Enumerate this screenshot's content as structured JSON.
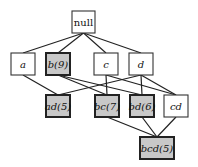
{
  "diagram": {
    "type": "itemset-lattice",
    "colors": {
      "edge": "#222222",
      "plain_fill": "#ffffff",
      "plain_border": "#333333",
      "frequent_fill": "#c8c8c8",
      "frequent_border": "#222222"
    },
    "nodes": [
      {
        "id": "null",
        "label": "null",
        "x": 72,
        "y": 11,
        "w": 23,
        "h": 22,
        "shaded": false,
        "italic": false
      },
      {
        "id": "a",
        "label": "a",
        "x": 11,
        "y": 53,
        "w": 24,
        "h": 22,
        "shaded": false,
        "italic": true
      },
      {
        "id": "b",
        "label": "b(9)",
        "x": 46,
        "y": 53,
        "w": 24,
        "h": 22,
        "shaded": true,
        "italic": true
      },
      {
        "id": "c",
        "label": "c",
        "x": 94,
        "y": 53,
        "w": 24,
        "h": 22,
        "shaded": false,
        "italic": true
      },
      {
        "id": "d",
        "label": "d",
        "x": 129,
        "y": 53,
        "w": 24,
        "h": 22,
        "shaded": false,
        "italic": true
      },
      {
        "id": "ad",
        "label": "ad(5)",
        "x": 46,
        "y": 95,
        "w": 24,
        "h": 22,
        "shaded": true,
        "italic": true
      },
      {
        "id": "bc",
        "label": "bc(7)",
        "x": 95,
        "y": 95,
        "w": 24,
        "h": 22,
        "shaded": true,
        "italic": true
      },
      {
        "id": "bd",
        "label": "bd(6)",
        "x": 130,
        "y": 95,
        "w": 24,
        "h": 22,
        "shaded": true,
        "italic": true
      },
      {
        "id": "cd",
        "label": "cd",
        "x": 164,
        "y": 95,
        "w": 24,
        "h": 22,
        "shaded": false,
        "italic": true
      },
      {
        "id": "bcd",
        "label": "bcd(5)",
        "x": 140,
        "y": 137,
        "w": 34,
        "h": 22,
        "shaded": true,
        "italic": true
      }
    ],
    "edges": [
      [
        "null",
        "a"
      ],
      [
        "null",
        "b"
      ],
      [
        "null",
        "c"
      ],
      [
        "null",
        "d"
      ],
      [
        "a",
        "ad"
      ],
      [
        "d",
        "ad"
      ],
      [
        "b",
        "bc"
      ],
      [
        "c",
        "bc"
      ],
      [
        "b",
        "bd"
      ],
      [
        "d",
        "bd"
      ],
      [
        "c",
        "cd"
      ],
      [
        "d",
        "cd"
      ],
      [
        "bc",
        "bcd"
      ],
      [
        "bd",
        "bcd"
      ],
      [
        "cd",
        "bcd"
      ]
    ]
  }
}
